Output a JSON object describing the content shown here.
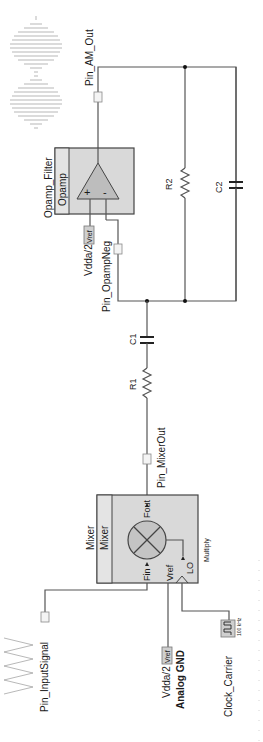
{
  "schematic": {
    "orientation": "rotated-90-ccw",
    "components": {
      "opamp": {
        "instance": "Opamp_Filter",
        "type": "Opamp",
        "plus": "+",
        "minus": "-"
      },
      "mixer": {
        "instance": "Mixer",
        "type": "Mixer",
        "mode": "Multiply",
        "pins": {
          "fin": "Fin",
          "fout": "Fout",
          "vref": "Vref",
          "lo": "LO"
        }
      },
      "r1": {
        "label": "R1"
      },
      "r2": {
        "label": "R2"
      },
      "c1": {
        "label": "C1"
      },
      "c2": {
        "label": "C2"
      },
      "clock": {
        "label": "Clock_Carrier",
        "frequency": "100 kHz"
      },
      "vref_opamp": {
        "value": "Vdda/2",
        "tag": "Vref"
      },
      "vref_mixer": {
        "value": "Vdda/2",
        "tag": "Vref",
        "sub": "Analog GND"
      }
    },
    "pins": {
      "am_out": {
        "label": "Pin_AM_Out"
      },
      "opamp_neg": {
        "label": "Pin_OpampNeg"
      },
      "mixer_out": {
        "label": "Pin_MixerOut"
      },
      "input_signal": {
        "label": "Pin_InputSignal"
      }
    },
    "waveforms": {
      "output": "am-modulated-waveform",
      "input": "triangle-input-waveform"
    }
  }
}
